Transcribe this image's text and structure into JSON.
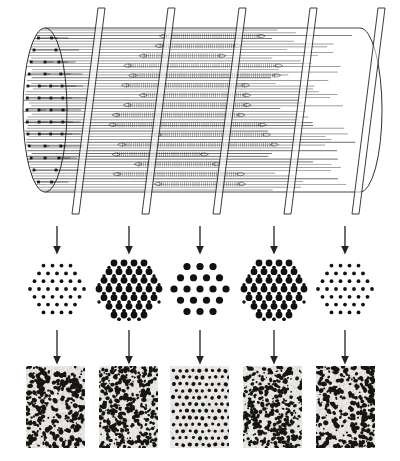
{
  "figure": {
    "row_count": 3
  },
  "cylinder": {
    "name": "sarcomere-cylinder",
    "plane_count": 5,
    "plane_labels": [
      "plane-1",
      "plane-2",
      "plane-3",
      "plane-4",
      "plane-5"
    ],
    "plane_x": [
      72,
      142,
      213,
      284,
      352
    ],
    "left_cap": "elliptical-end-face",
    "right_cap": "elliptical-end-face",
    "filament_line_count": 58,
    "ink": "#1b1b1b",
    "fill": "#ffffff"
  },
  "arrows_top": {
    "name": "section-arrows-top",
    "count": 5,
    "x": [
      57,
      129,
      200,
      274,
      345
    ],
    "color": "#222222",
    "direction": "down"
  },
  "arrows_bottom": {
    "name": "section-arrows-bottom",
    "count": 5,
    "x": [
      57,
      129,
      200,
      274,
      345
    ],
    "color": "#222222",
    "direction": "down"
  },
  "lattices": [
    {
      "id": "lattice-1",
      "label": "sparse-thin-filament-lattice",
      "center_x": 57,
      "radius": 30,
      "thick_dot_radius": 0,
      "thin_dot_radius": 1.9,
      "has_thick": false,
      "has_thin": true,
      "rows": 7,
      "spacing": 9.0,
      "dot_color": "#111111"
    },
    {
      "id": "lattice-2",
      "label": "dense-overlap-lattice",
      "center_x": 129,
      "radius": 33,
      "thick_dot_radius": 3.4,
      "thin_dot_radius": 1.7,
      "has_thick": true,
      "has_thin": true,
      "rows": 7,
      "spacing": 10.0,
      "dot_color": "#111111"
    },
    {
      "id": "lattice-3",
      "label": "thick-filament-only-lattice",
      "center_x": 200,
      "radius": 33,
      "thick_dot_radius": 3.6,
      "thin_dot_radius": 0,
      "has_thick": true,
      "has_thin": false,
      "rows": 6,
      "spacing": 13.0,
      "dot_color": "#111111"
    },
    {
      "id": "lattice-4",
      "label": "dense-overlap-lattice",
      "center_x": 274,
      "radius": 33,
      "thick_dot_radius": 3.4,
      "thin_dot_radius": 1.7,
      "has_thick": true,
      "has_thin": true,
      "rows": 7,
      "spacing": 10.0,
      "dot_color": "#111111"
    },
    {
      "id": "lattice-5",
      "label": "sparse-thin-filament-lattice",
      "center_x": 345,
      "radius": 30,
      "thick_dot_radius": 0,
      "thin_dot_radius": 1.9,
      "has_thick": false,
      "has_thin": true,
      "rows": 7,
      "spacing": 9.0,
      "dot_color": "#111111"
    }
  ],
  "micrographs": [
    {
      "id": "micrograph-1",
      "label": "disordered-speckle-micrograph",
      "x": 26,
      "density": 0.3,
      "ordered": false,
      "blob_size": 3.0,
      "background": "#e8e6e2"
    },
    {
      "id": "micrograph-2",
      "label": "dense-speckle-micrograph",
      "x": 99,
      "density": 0.4,
      "ordered": false,
      "blob_size": 2.6,
      "background": "#ebe9e5"
    },
    {
      "id": "micrograph-3",
      "label": "ordered-lattice-micrograph",
      "x": 170,
      "density": 0.22,
      "ordered": true,
      "blob_size": 3.0,
      "background": "#eeece9"
    },
    {
      "id": "micrograph-4",
      "label": "dense-speckle-micrograph",
      "x": 243,
      "density": 0.38,
      "ordered": false,
      "blob_size": 2.6,
      "background": "#eae8e4"
    },
    {
      "id": "micrograph-5",
      "label": "disordered-speckle-micrograph",
      "x": 316,
      "density": 0.32,
      "ordered": false,
      "blob_size": 3.0,
      "background": "#e9e7e3"
    }
  ]
}
